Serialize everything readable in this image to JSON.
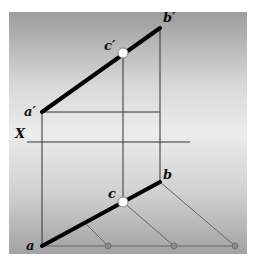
{
  "diagram": {
    "labels": {
      "a_prime": "a′",
      "b_prime": "b′",
      "c_prime": "c′",
      "a": "a",
      "b": "b",
      "c": "c",
      "x_axis": "X"
    },
    "colors": {
      "background_top": "#9a9a9a",
      "background_mid": "#e6e6e6",
      "background_bottom": "#a0a0a0",
      "thick_line": "#000000",
      "thin_line": "#333333",
      "construction_line": "#666666",
      "point_fill": "#ffffff",
      "small_dot": "#7a7a7a"
    },
    "points": {
      "a_prime": [
        42,
        112
      ],
      "b_prime": [
        160,
        28
      ],
      "c_prime": [
        123,
        53
      ],
      "a": [
        42,
        246
      ],
      "b": [
        160,
        182
      ],
      "c": [
        123,
        202
      ]
    }
  }
}
